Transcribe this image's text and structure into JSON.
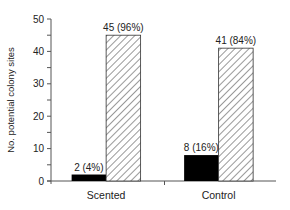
{
  "chart_data": {
    "type": "bar",
    "title": "",
    "xlabel": "",
    "ylabel": "No. potential colony sites",
    "ylim": [
      0,
      50
    ],
    "yticks": [
      0,
      10,
      20,
      30,
      40,
      50
    ],
    "yminor_step": 5,
    "grid": false,
    "legend": "none",
    "categories": [
      "Scented",
      "Control"
    ],
    "series": [
      {
        "name": "occupied",
        "fill": "solid",
        "color": "#000000",
        "values": [
          2,
          8
        ],
        "labels": [
          "2 (4%)",
          "8 (16%)"
        ]
      },
      {
        "name": "unoccupied",
        "fill": "hatched",
        "color": "#444444",
        "values": [
          45,
          41
        ],
        "labels": [
          "45 (96%)",
          "41 (84%)"
        ]
      }
    ]
  }
}
